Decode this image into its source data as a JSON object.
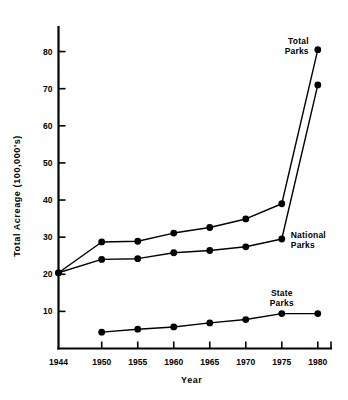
{
  "chart_data": {
    "type": "line",
    "title": "",
    "xlabel": "Year",
    "ylabel": "Total Acreage (100,000's)",
    "xlim": [
      1944,
      1981
    ],
    "ylim": [
      0,
      85
    ],
    "grid": false,
    "legend_position": "inline-annotations",
    "x_ticks": [
      1944,
      1950,
      1955,
      1960,
      1965,
      1970,
      1975,
      1980
    ],
    "x_tick_labels": [
      "1944",
      "1950",
      "1955",
      "1960",
      "1965",
      "1970",
      "1975",
      "1980"
    ],
    "y_ticks": [
      10,
      20,
      30,
      40,
      50,
      60,
      70,
      80
    ],
    "y_tick_labels": [
      "10",
      "20",
      "30",
      "40",
      "50",
      "60",
      "70",
      "80"
    ],
    "series": [
      {
        "name": "Total Parks",
        "label": "Total\nParks",
        "label_line_1": "Total",
        "label_line_2": "Parks",
        "x": [
          1944,
          1950,
          1955,
          1960,
          1965,
          1970,
          1975,
          1980
        ],
        "values": [
          20.4,
          28.7,
          28.9,
          31.1,
          32.6,
          34.9,
          39.0,
          80.5
        ]
      },
      {
        "name": "National Parks",
        "label": "National\nParks",
        "label_line_1": "National",
        "label_line_2": "Parks",
        "x": [
          1944,
          1950,
          1955,
          1960,
          1965,
          1970,
          1975,
          1980
        ],
        "values": [
          20.4,
          24.0,
          24.2,
          25.8,
          26.4,
          27.4,
          29.5,
          71.0
        ]
      },
      {
        "name": "State Parks",
        "label": "State\nParks",
        "label_line_1": "State",
        "label_line_2": "Parks",
        "x": [
          1950,
          1955,
          1960,
          1965,
          1970,
          1975,
          1980
        ],
        "values": [
          4.4,
          5.2,
          5.8,
          6.9,
          7.8,
          9.4,
          9.4
        ]
      }
    ],
    "annotations": [
      {
        "text_line_1": "Total",
        "text_line_2": "Parks",
        "x": 1980,
        "y": 80.5
      },
      {
        "text_line_1": "National",
        "text_line_2": "Parks",
        "x": 1975,
        "y": 29.5
      },
      {
        "text_line_1": "State",
        "text_line_2": "Parks",
        "x": 1975,
        "y": 9.4
      }
    ]
  },
  "axes": {
    "y_title": "Total Acreage (100,000's)",
    "x_title": "Year"
  },
  "colors": {
    "ink": "#000000",
    "background": "#ffffff"
  }
}
